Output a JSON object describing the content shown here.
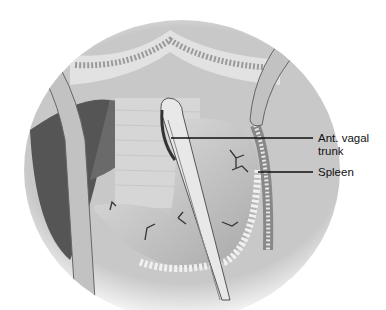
{
  "figure": {
    "labels": [
      {
        "id": "ant-vagal-trunk",
        "text_line1": "Ant. vagal",
        "text_line2": "trunk"
      },
      {
        "id": "spleen",
        "text_line1": "Spleen"
      }
    ],
    "colors": {
      "background": "#ffffff",
      "tissue_light": "#d9d9d9",
      "tissue_dark": "#5a5a5a",
      "leader": "#111111"
    }
  }
}
